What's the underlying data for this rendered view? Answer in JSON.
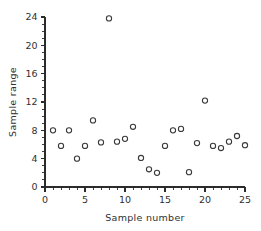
{
  "chart_data": {
    "type": "scatter",
    "title": "",
    "xlabel": "Sample number",
    "ylabel": "Sample range",
    "xlim": [
      0,
      25
    ],
    "ylim": [
      0,
      24
    ],
    "grid": false,
    "legend": null,
    "x_major_ticks": [
      0,
      5,
      10,
      15,
      20,
      25
    ],
    "x_tick_labels": [
      "0",
      "5",
      "10",
      "15",
      "20",
      "25"
    ],
    "x_minor_interval": 1,
    "y_major_ticks": [
      0,
      4,
      8,
      12,
      16,
      20,
      24
    ],
    "y_tick_labels": [
      "0",
      "4",
      "8",
      "12",
      "16",
      "20",
      "24"
    ],
    "y_minor_interval": 1,
    "marker": "open-circle",
    "marker_color": "#3a3a3a",
    "x": [
      1,
      2,
      3,
      4,
      5,
      6,
      7,
      8,
      9,
      10,
      11,
      12,
      13,
      14,
      15,
      16,
      17,
      18,
      19,
      20,
      21,
      22,
      23,
      24,
      25
    ],
    "values": [
      8.0,
      5.8,
      8.0,
      4.0,
      5.8,
      9.4,
      6.3,
      23.8,
      6.4,
      6.8,
      8.5,
      4.1,
      2.5,
      2.0,
      5.8,
      8.0,
      8.2,
      2.1,
      6.2,
      12.2,
      5.8,
      5.5,
      6.4,
      7.2,
      5.9
    ],
    "series": [
      {
        "name": "Sample range",
        "points": [
          {
            "x": 1,
            "y": 8.0
          },
          {
            "x": 2,
            "y": 5.8
          },
          {
            "x": 3,
            "y": 8.0
          },
          {
            "x": 4,
            "y": 4.0
          },
          {
            "x": 5,
            "y": 5.8
          },
          {
            "x": 6,
            "y": 9.4
          },
          {
            "x": 7,
            "y": 6.3
          },
          {
            "x": 8,
            "y": 23.8
          },
          {
            "x": 9,
            "y": 6.4
          },
          {
            "x": 10,
            "y": 6.8
          },
          {
            "x": 11,
            "y": 8.5
          },
          {
            "x": 12,
            "y": 4.1
          },
          {
            "x": 13,
            "y": 2.5
          },
          {
            "x": 14,
            "y": 2.0
          },
          {
            "x": 15,
            "y": 5.8
          },
          {
            "x": 16,
            "y": 8.0
          },
          {
            "x": 17,
            "y": 8.2
          },
          {
            "x": 18,
            "y": 2.1
          },
          {
            "x": 19,
            "y": 6.2
          },
          {
            "x": 20,
            "y": 12.2
          },
          {
            "x": 21,
            "y": 5.8
          },
          {
            "x": 22,
            "y": 5.5
          },
          {
            "x": 23,
            "y": 6.4
          },
          {
            "x": 24,
            "y": 7.2
          },
          {
            "x": 25,
            "y": 5.9
          }
        ]
      }
    ]
  }
}
